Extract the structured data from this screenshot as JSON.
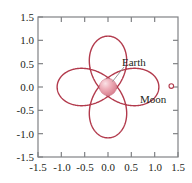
{
  "chart_data": {
    "type": "line",
    "title": "",
    "xlabel": "",
    "ylabel": "",
    "xlim": [
      -1.5,
      1.5
    ],
    "ylim": [
      -1.5,
      1.5
    ],
    "grid": false,
    "legend_position": "none",
    "curve_color": "#b23a4c",
    "x_ticks": [
      -1.5,
      -1.0,
      -0.5,
      0.0,
      0.5,
      1.0,
      1.5
    ],
    "x_tick_labels": [
      "-1.5",
      "-1.0",
      "-0.5",
      "0.0",
      "0.5",
      "1.0",
      "1.5"
    ],
    "y_ticks": [
      -1.5,
      -1.0,
      -0.5,
      0.0,
      0.5,
      1.0,
      1.5
    ],
    "y_tick_labels": [
      "-1.5",
      "-1.0",
      "-0.5",
      "0.0",
      "0.5",
      "1.0",
      "1.5"
    ],
    "annotations": [
      {
        "name": "earth",
        "label": "Earth",
        "x": 0.12,
        "y": 0.55,
        "point_x": 0.0,
        "point_y": 0.0
      },
      {
        "name": "moon",
        "label": "Moon",
        "x": 1.02,
        "y": -0.33,
        "point_x": 0.97,
        "point_y": 0.02
      }
    ],
    "markers": [
      {
        "name": "earth-body",
        "x": 0.0,
        "y": 0.0,
        "radius_px": 9,
        "color": "#e79aa6",
        "highlight_color": "#f6d3d9"
      },
      {
        "name": "moon-body",
        "x": 0.97,
        "y": 0.02,
        "radius_px": 2,
        "color": "#ffffff",
        "edge_color": "#b23a4c"
      }
    ],
    "series": [
      {
        "name": "moon-path",
        "comment": "parametric epitrochoid: x = a*cos(t) + b*cos(3t), y = a*sin(t) - b*sin(3t)",
        "params": {
          "a": 0.47,
          "b": 0.62,
          "k": 3
        },
        "x": [
          0.97,
          0.86,
          0.55,
          0.17,
          -0.14,
          -0.33,
          -0.41,
          -0.46,
          -0.55,
          -0.71,
          -0.89,
          -1.02,
          -1.05,
          -0.97,
          -0.8,
          -0.6,
          -0.42,
          -0.3,
          -0.24,
          -0.25,
          -0.3,
          -0.35,
          -0.37,
          -0.34,
          -0.24,
          -0.07,
          0.16,
          0.42,
          0.68,
          0.87,
          0.97,
          1.01,
          0.99,
          0.91,
          0.8,
          0.7,
          0.65,
          0.68,
          0.79,
          0.92,
          0.97
        ],
        "y": [
          0.02,
          0.27,
          0.41,
          0.42,
          0.37,
          0.39,
          0.51,
          0.71,
          0.92,
          1.07,
          1.1,
          0.99,
          0.79,
          0.57,
          0.38,
          0.22,
          0.07,
          -0.09,
          -0.28,
          -0.49,
          -0.7,
          -0.89,
          -1.0,
          -1.05,
          -1.04,
          -0.96,
          -0.82,
          -0.63,
          -0.42,
          -0.22,
          -0.06,
          0.05,
          0.14,
          0.18,
          0.15,
          0.08,
          -0.01,
          -0.09,
          -0.12,
          -0.08,
          0.02
        ]
      }
    ]
  },
  "axes": {
    "frame_color": "#808285",
    "tick_color": "#808285"
  },
  "labels": {
    "earth": "Earth",
    "moon": "Moon"
  }
}
